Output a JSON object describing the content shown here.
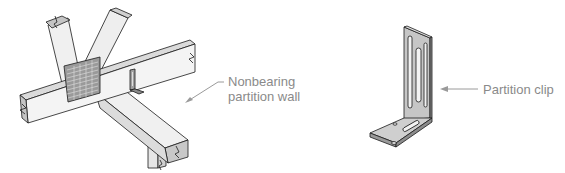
{
  "figures": [
    {
      "id": "truss-assembly",
      "description": "Truss framing intersection with gusset plate and partition clip",
      "callout": {
        "lines": [
          "Nonbearing",
          "partition wall"
        ]
      }
    },
    {
      "id": "clip-detail",
      "description": "L-shaped slotted metal partition clip",
      "callout": {
        "text": "Partition clip"
      }
    }
  ],
  "colors": {
    "line": "#1a1a1a",
    "wood_face": "#f2f2f2",
    "wood_side": "#d8d8d8",
    "end_grain": "#c4c4c4",
    "metal": "#b8b8b8",
    "metal_dark": "#8c8c8c",
    "label": "#8a8a8a"
  }
}
